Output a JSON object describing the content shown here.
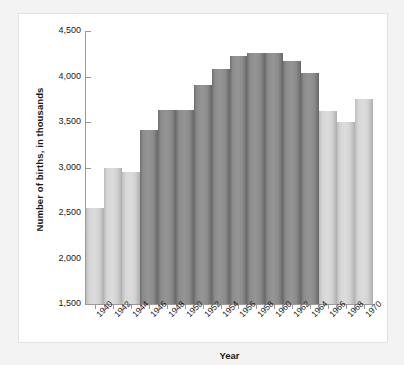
{
  "chart_data": {
    "type": "bar",
    "title": "",
    "xlabel": "Year",
    "ylabel": "Number of births, in thousands",
    "categories": [
      "1940",
      "1942",
      "1944",
      "1946",
      "1948",
      "1950",
      "1952",
      "1954",
      "1956",
      "1958",
      "1960",
      "1962",
      "1964",
      "1966",
      "1968",
      "1970"
    ],
    "values": [
      2550,
      3000,
      2950,
      3410,
      3630,
      3630,
      3910,
      4080,
      4220,
      4260,
      4260,
      4170,
      4040,
      3620,
      3500,
      3750
    ],
    "bar_shades": [
      "light",
      "light",
      "light",
      "dark",
      "dark",
      "dark",
      "dark",
      "dark",
      "dark",
      "dark",
      "dark",
      "dark",
      "dark",
      "light",
      "light",
      "light"
    ],
    "ylim": [
      1500,
      4500
    ],
    "ytick_values": [
      4500,
      4000,
      3500,
      3000,
      2500,
      2000,
      1500
    ],
    "ytick_labels": [
      "4,500",
      "4,000",
      "3,500",
      "3,000",
      "2,500",
      "2,000",
      "1,500"
    ],
    "grid": false,
    "legend": false,
    "colors": {
      "bar_light": "#d6d6d6",
      "bar_dark": "#8c8c8c",
      "axis": "#9a9a9a",
      "text": "#1a1a1a",
      "card_background": "#ffffff",
      "page_background": "#f3f3f3"
    }
  }
}
